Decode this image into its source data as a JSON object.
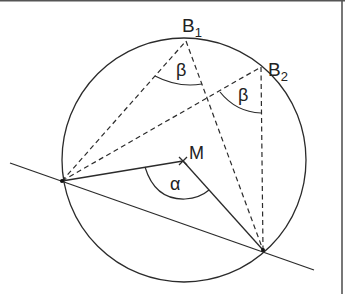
{
  "labels": {
    "b1": "B",
    "b1_sub": "1",
    "b2": "B",
    "b2_sub": "2",
    "m": "M",
    "alpha": "α",
    "beta1": "β",
    "beta2": "β"
  },
  "colors": {
    "stroke": "#2b2b2b",
    "frame": "#555555",
    "background": "#ffffff"
  }
}
